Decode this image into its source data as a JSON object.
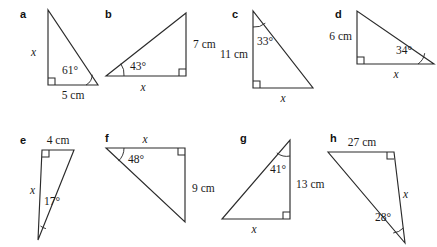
{
  "page": {
    "background_color": "#ffffff",
    "stroke_color": "#2b2b2b",
    "text_color": "#1a1a1a",
    "width": 437,
    "height": 247
  },
  "figures": [
    {
      "letter": "a",
      "letter_pos": {
        "x": 20,
        "y": 18
      },
      "points": "48,10 48,85 98,85",
      "right_angle": {
        "x": 48,
        "y": 85,
        "dx": 1,
        "dy": -1,
        "size": 7
      },
      "arc": {
        "d": "M 86,85 A 12,12 0 0 0 92.2,74.7"
      },
      "labels": [
        {
          "name": "side-x",
          "kind": "var",
          "text": "x",
          "x": 31,
          "y": 56,
          "anchor": "start"
        },
        {
          "name": "side-5cm",
          "kind": "len",
          "text": "5 cm",
          "x": 73,
          "y": 99,
          "anchor": "middle"
        },
        {
          "name": "angle-61",
          "kind": "ang",
          "text": "61°",
          "x": 78,
          "y": 74,
          "anchor": "end"
        }
      ]
    },
    {
      "letter": "b",
      "letter_pos": {
        "x": 105,
        "y": 18
      },
      "points": "106,76 186,76 186,13",
      "right_angle": {
        "x": 186,
        "y": 76,
        "dx": -1,
        "dy": -1,
        "size": 7
      },
      "arc": {
        "d": "M 124,76 A 18,18 0 0 0 120.8,63.7"
      },
      "labels": [
        {
          "name": "side-7cm",
          "kind": "len",
          "text": "7 cm",
          "x": 193,
          "y": 48,
          "anchor": "start"
        },
        {
          "name": "side-x",
          "kind": "var",
          "text": "x",
          "x": 143,
          "y": 91,
          "anchor": "middle"
        },
        {
          "name": "angle-43",
          "kind": "ang",
          "text": "43°",
          "x": 130,
          "y": 70,
          "anchor": "start"
        }
      ]
    },
    {
      "letter": "c",
      "letter_pos": {
        "x": 232,
        "y": 18
      },
      "points": "253,11 253,88 313,88",
      "right_angle": {
        "x": 253,
        "y": 88,
        "dx": 1,
        "dy": -1,
        "size": 7
      },
      "arc": {
        "d": "M 253,27 A 16,16 0 0 0 265.3,23.2"
      },
      "labels": [
        {
          "name": "side-11cm",
          "kind": "len",
          "text": "11 cm",
          "x": 248,
          "y": 58,
          "anchor": "end"
        },
        {
          "name": "side-x",
          "kind": "var",
          "text": "x",
          "x": 283,
          "y": 102,
          "anchor": "middle"
        },
        {
          "name": "angle-33",
          "kind": "ang",
          "text": "33°",
          "x": 257,
          "y": 45,
          "anchor": "start"
        }
      ]
    },
    {
      "letter": "d",
      "letter_pos": {
        "x": 335,
        "y": 18
      },
      "points": "357,11 357,64 434,64",
      "right_angle": {
        "x": 357,
        "y": 64,
        "dx": 1,
        "dy": -1,
        "size": 7
      },
      "arc": {
        "d": "M 418,64 A 16,16 0 0 0 424.7,53.2"
      },
      "labels": [
        {
          "name": "side-6cm",
          "kind": "len",
          "text": "6 cm",
          "x": 352,
          "y": 40,
          "anchor": "end"
        },
        {
          "name": "side-x",
          "kind": "var",
          "text": "x",
          "x": 396,
          "y": 78,
          "anchor": "middle"
        },
        {
          "name": "angle-34",
          "kind": "ang",
          "text": "34°",
          "x": 412,
          "y": 54,
          "anchor": "end"
        }
      ]
    },
    {
      "letter": "e",
      "letter_pos": {
        "x": 20,
        "y": 144
      },
      "points": "42,150 74,150 38,240",
      "right_angle": {
        "x": 42,
        "y": 150,
        "dx": 1,
        "dy": 1,
        "size": 7
      },
      "arc": {
        "d": "M 40.5,226 A 14,14 0 0 0 45.9,228.6"
      },
      "labels": [
        {
          "name": "side-4cm",
          "kind": "len",
          "text": "4 cm",
          "x": 58,
          "y": 144,
          "anchor": "middle"
        },
        {
          "name": "side-x",
          "kind": "var",
          "text": "x",
          "x": 35,
          "y": 194,
          "anchor": "end"
        },
        {
          "name": "angle-17",
          "kind": "ang",
          "text": "17°",
          "x": 44,
          "y": 205,
          "anchor": "start"
        }
      ]
    },
    {
      "letter": "f",
      "letter_pos": {
        "x": 105,
        "y": 142
      },
      "points": "106,148 185,148 185,222",
      "right_angle": {
        "x": 185,
        "y": 148,
        "dx": -1,
        "dy": 1,
        "size": 7
      },
      "arc": {
        "d": "M 124,148 A 18,18 0 0 1 118.4,161.1"
      },
      "labels": [
        {
          "name": "side-x",
          "kind": "var",
          "text": "x",
          "x": 145,
          "y": 143,
          "anchor": "middle"
        },
        {
          "name": "side-9cm",
          "kind": "len",
          "text": "9 cm",
          "x": 192,
          "y": 192,
          "anchor": "start"
        },
        {
          "name": "angle-48",
          "kind": "ang",
          "text": "48°",
          "x": 128,
          "y": 163,
          "anchor": "start"
        }
      ]
    },
    {
      "letter": "g",
      "letter_pos": {
        "x": 240,
        "y": 142
      },
      "points": "290,140 290,219 222,219",
      "right_angle": {
        "x": 290,
        "y": 219,
        "dx": -1,
        "dy": -1,
        "size": 7
      },
      "arc": {
        "d": "M 290,156 A 16,16 0 0 1 276.8,152.9"
      },
      "labels": [
        {
          "name": "side-13cm",
          "kind": "len",
          "text": "13 cm",
          "x": 296,
          "y": 188,
          "anchor": "start"
        },
        {
          "name": "side-x",
          "kind": "var",
          "text": "x",
          "x": 254,
          "y": 233,
          "anchor": "middle"
        },
        {
          "name": "angle-41",
          "kind": "ang",
          "text": "41°",
          "x": 286,
          "y": 173,
          "anchor": "end"
        }
      ]
    },
    {
      "letter": "h",
      "letter_pos": {
        "x": 330,
        "y": 142
      },
      "points": "328,152 394,152 405,243",
      "right_angle": {
        "x": 394,
        "y": 152,
        "dx": -1,
        "dy": 1,
        "size": 7
      },
      "arc": {
        "d": "M 403.3,228 A 16,16 0 0 1 393.2,233.0"
      },
      "labels": [
        {
          "name": "side-27cm",
          "kind": "len",
          "text": "27 cm",
          "x": 362,
          "y": 146,
          "anchor": "middle"
        },
        {
          "name": "side-x",
          "kind": "var",
          "text": "x",
          "x": 403,
          "y": 198,
          "anchor": "start"
        },
        {
          "name": "angle-28",
          "kind": "ang",
          "text": "28°",
          "x": 391,
          "y": 221,
          "anchor": "end"
        }
      ]
    }
  ]
}
